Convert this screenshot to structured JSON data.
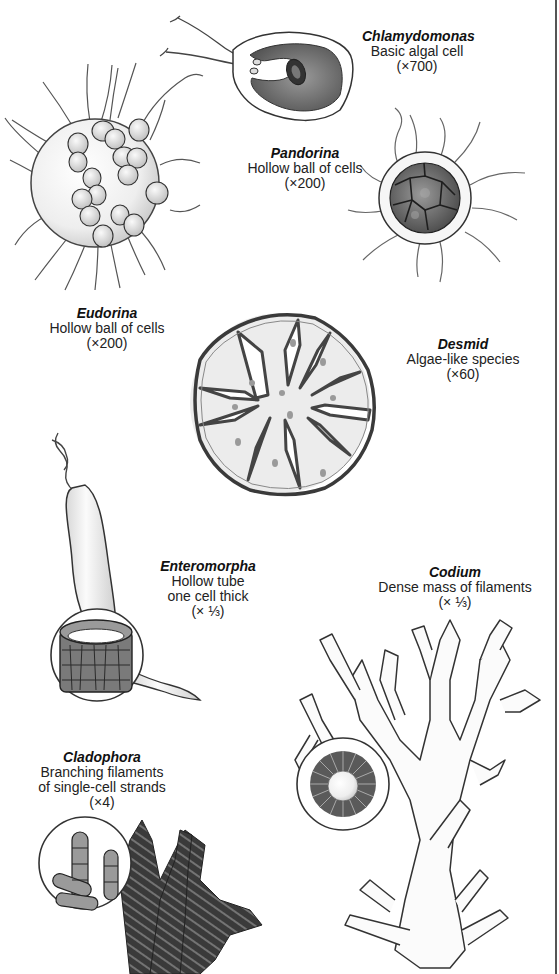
{
  "figure": {
    "type": "illustrated comparison of algae body forms",
    "colors": {
      "background": "#ffffff",
      "ink": "#1c1c1c",
      "fill_light": "#e9e9e9",
      "fill_mid": "#b8b8b8",
      "fill_dark": "#6a6a6a"
    }
  },
  "species": [
    {
      "id": "chlamydomonas",
      "name": "Chlamydomonas",
      "lines": [
        "Basic algal cell"
      ],
      "scale": "(×700)"
    },
    {
      "id": "pandorina",
      "name": "Pandorina",
      "lines": [
        "Hollow ball of cells"
      ],
      "scale": "(×200)"
    },
    {
      "id": "eudorina",
      "name": "Eudorina",
      "lines": [
        "Hollow ball of cells"
      ],
      "scale": "(×200)"
    },
    {
      "id": "desmid",
      "name": "Desmid",
      "lines": [
        "Algae-like species"
      ],
      "scale": "(×60)"
    },
    {
      "id": "enteromorpha",
      "name": "Enteromorpha",
      "lines": [
        "Hollow tube",
        "one cell thick"
      ],
      "scale": "(× ⅓)"
    },
    {
      "id": "codium",
      "name": "Codium",
      "lines": [
        "Dense mass of filaments"
      ],
      "scale": "(× ⅓)"
    },
    {
      "id": "cladophora",
      "name": "Cladophora",
      "lines": [
        "Branching filaments",
        "of single-cell strands"
      ],
      "scale": "(×4)"
    }
  ]
}
